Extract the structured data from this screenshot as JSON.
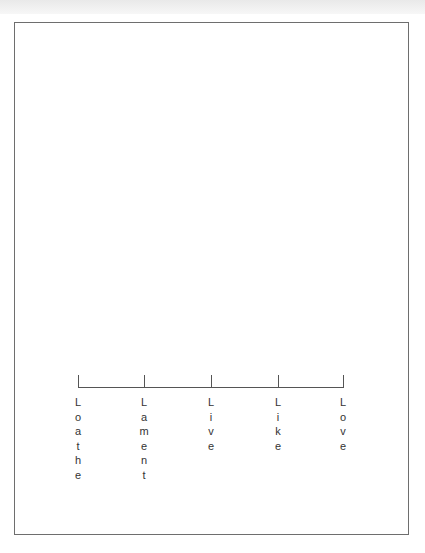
{
  "scale": {
    "points": [
      {
        "label": "Loathe",
        "x": 78
      },
      {
        "label": "Lament",
        "x": 144
      },
      {
        "label": "Live",
        "x": 211
      },
      {
        "label": "Like",
        "x": 278
      },
      {
        "label": "Love",
        "x": 343
      }
    ]
  },
  "colors": {
    "frame": "#6e6e6e",
    "line": "#555555",
    "text": "#333333"
  }
}
